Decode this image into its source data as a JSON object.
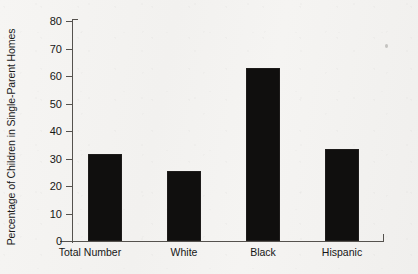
{
  "chart_data": {
    "type": "bar",
    "title": "",
    "subtitle": "",
    "xlabel": "",
    "ylabel": "Percentage of Children in Single-Parent Homes",
    "categories": [
      "Total Number",
      "White",
      "Black",
      "Hispanic"
    ],
    "values": [
      31.5,
      25.5,
      63,
      33.5
    ],
    "series": [
      {
        "name": "Percentage of Children in Single-Parent Homes",
        "values": [
          31.5,
          25.5,
          63,
          33.5
        ]
      }
    ],
    "ylim": [
      0,
      80
    ],
    "y_ticks": [
      0,
      10,
      20,
      30,
      40,
      50,
      60,
      70,
      80
    ],
    "y_tick_labels": [
      "0",
      "10",
      "20",
      "30",
      "40",
      "50",
      "60",
      "70",
      "80"
    ],
    "grid": false,
    "legend": false,
    "legend_position": "none",
    "bar_color": "#100f0e",
    "axis_color": "#55524e",
    "background_color": "#f3f2f0",
    "annotations": []
  },
  "axis": {
    "y_title": "Percentage of Children in Single-Parent Homes"
  },
  "x_labels": {
    "0": "Total Number",
    "1": "White",
    "2": "Black",
    "3": "Hispanic"
  },
  "y_labels": {
    "0": "80",
    "1": "70",
    "2": "60",
    "3": "50",
    "4": "40",
    "5": "30",
    "6": "20",
    "7": "10",
    "8": "0"
  }
}
